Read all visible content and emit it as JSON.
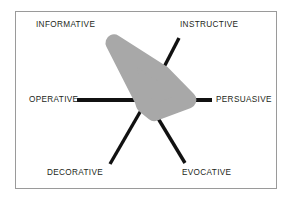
{
  "figure": {
    "title": "",
    "frame": {
      "border_color": "#9a9a9a",
      "background": "#ffffff"
    },
    "axis_color": "#111111",
    "series_color": "#a8a8a8"
  },
  "labels": {
    "informative": "INFORMATIVE",
    "instructive": "INSTRUCTIVE",
    "operative": "OPERATIVE",
    "persuasive": "PERSUASIVE",
    "decorative": "DECORATIVE",
    "evocative": "EVOCATIVE"
  },
  "chart_data": {
    "type": "radar",
    "title": "",
    "xlabel": "",
    "ylabel": "",
    "grid": false,
    "legend": "none",
    "center": [
      147,
      100
    ],
    "axis_length": 66,
    "categories": [
      "INFORMATIVE",
      "INSTRUCTIVE",
      "PERSUASIVE",
      "EVOCATIVE",
      "DECORATIVE",
      "OPERATIVE"
    ],
    "category_angles_deg": [
      120,
      60,
      0,
      -60,
      -120,
      180
    ],
    "rlim": [
      0,
      100
    ],
    "series": [
      {
        "name": "profile",
        "values": [
          100,
          46,
          62,
          22,
          8,
          6
        ]
      }
    ],
    "annotations": []
  }
}
